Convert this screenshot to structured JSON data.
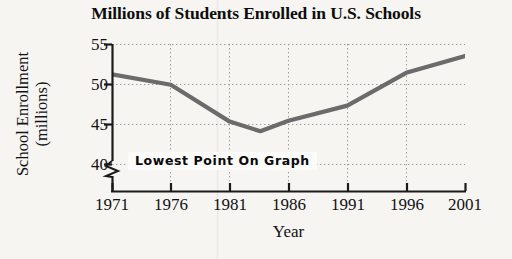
{
  "chart_data": {
    "type": "line",
    "title": "Millions of Students Enrolled in U.S. Schools",
    "xlabel": "Year",
    "ylabel_line1": "School Enrollment",
    "ylabel_line2": "(millions)",
    "xlim": [
      1971,
      2001
    ],
    "ylim": [
      38.2,
      55
    ],
    "yticks": [
      55,
      50,
      45,
      40
    ],
    "ytick_labels": [
      "55",
      "50",
      "45",
      "40"
    ],
    "xticks": [
      1971,
      1976,
      1981,
      1986,
      1991,
      1996,
      2001
    ],
    "xtick_labels": [
      "1971",
      "1976",
      "1981",
      "1986",
      "1991",
      "1996",
      "2001"
    ],
    "grid": true,
    "grid_style": "dotted",
    "legend": "none",
    "y_axis_break": true,
    "series": [
      {
        "name": "U.S. school enrollment",
        "color": "#6b6b6b",
        "x": [
          1971,
          1976,
          1981,
          1983.6,
          1986,
          1991,
          1996,
          2001
        ],
        "values": [
          51.2,
          49.9,
          45.3,
          44.1,
          45.4,
          47.3,
          51.4,
          53.5
        ]
      }
    ],
    "annotations": [
      {
        "text": "Lowest Point On Graph",
        "x": 1983.6,
        "y": 40.0,
        "style": "boxed-bold-sans"
      }
    ]
  },
  "colors": {
    "background": "#f6f5f2",
    "line": "#6b6b6b",
    "axis": "#1a1a1a",
    "grid": "#9a9a9a",
    "text": "#121212",
    "annotation_box": "#fbfbf9"
  }
}
